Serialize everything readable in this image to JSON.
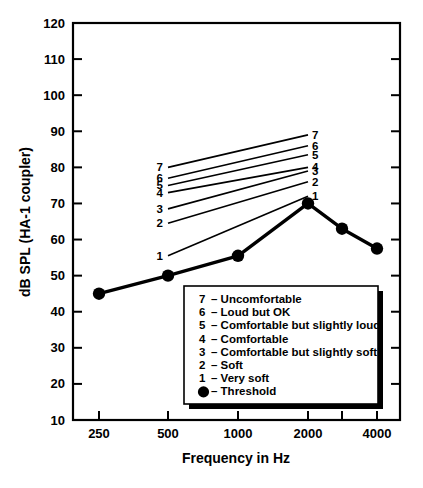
{
  "chart_data": {
    "type": "line",
    "title": "",
    "xlabel": "Frequency in Hz",
    "ylabel": "dB SPL (HA-1 coupler)",
    "x_tick_labels": [
      "250",
      "500",
      "1000",
      "2000",
      "",
      "4000"
    ],
    "x_tick_values": [
      250,
      500,
      1000,
      2000,
      3000,
      4000
    ],
    "y_tick_labels": [
      "10",
      "20",
      "30",
      "40",
      "50",
      "60",
      "70",
      "80",
      "90",
      "100",
      "110",
      "120"
    ],
    "ylim": [
      10,
      120
    ],
    "grid": false,
    "legend_position": "inside-bottom-center",
    "series": [
      {
        "name": "Threshold",
        "marker": "filled-circle",
        "x": [
          250,
          500,
          1000,
          2000,
          3000,
          4000
        ],
        "values": [
          45,
          50,
          55.5,
          70,
          63,
          57.5
        ]
      },
      {
        "name": "1",
        "label_left": "1",
        "label_right": "1",
        "x": [
          500,
          2000
        ],
        "values": [
          55.5,
          72
        ]
      },
      {
        "name": "2",
        "label_left": "2",
        "label_right": "2",
        "x": [
          500,
          2000
        ],
        "values": [
          64.5,
          76
        ]
      },
      {
        "name": "3",
        "label_left": "3",
        "label_right": "3",
        "x": [
          500,
          2000
        ],
        "values": [
          68.5,
          79
        ]
      },
      {
        "name": "4",
        "label_left": "4",
        "label_right": "4",
        "x": [
          500,
          2000
        ],
        "values": [
          73,
          80
        ]
      },
      {
        "name": "5",
        "label_left": "5",
        "label_right": "5",
        "x": [
          500,
          2000
        ],
        "values": [
          75,
          83.5
        ]
      },
      {
        "name": "6",
        "label_left": "6",
        "label_right": "6",
        "x": [
          500,
          2000
        ],
        "values": [
          77,
          86
        ]
      },
      {
        "name": "7",
        "label_left": "7",
        "label_right": "7",
        "x": [
          500,
          2000
        ],
        "values": [
          80,
          89
        ]
      }
    ],
    "legend": {
      "entries": [
        {
          "key": "7",
          "dash": "–",
          "label": "Uncomfortable"
        },
        {
          "key": "6",
          "dash": "–",
          "label": "Loud but OK"
        },
        {
          "key": "5",
          "dash": "–",
          "label": "Comfortable but slightly loud"
        },
        {
          "key": "4",
          "dash": "–",
          "label": "Comfortable"
        },
        {
          "key": "3",
          "dash": "–",
          "label": "Comfortable but slightly soft"
        },
        {
          "key": "2",
          "dash": "–",
          "label": "Soft"
        },
        {
          "key": "1",
          "dash": "–",
          "label": "Very soft"
        },
        {
          "key": "●",
          "dash": "–",
          "label": "Threshold"
        }
      ]
    },
    "colors": {
      "line": "#000000",
      "text": "#000000",
      "background": "#ffffff",
      "legend_shadow": "#000000"
    }
  }
}
